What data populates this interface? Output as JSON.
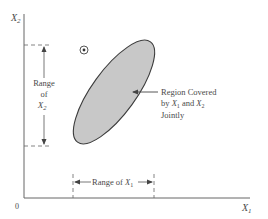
{
  "diagram": {
    "axes": {
      "y_label": "X",
      "y_label_sub": "2",
      "x_label": "X",
      "x_label_sub": "1",
      "origin_label": "0"
    },
    "range_x2": {
      "line1": "Range",
      "line2": "of",
      "line3_var": "X",
      "line3_sub": "2"
    },
    "range_x1": {
      "prefix": "Range of ",
      "var": "X",
      "sub": "1"
    },
    "region_annotation": {
      "line1": "Region Covered",
      "line2_prefix": "by ",
      "line2_var1": "X",
      "line2_sub1": "1",
      "line2_mid": " and ",
      "line2_var2": "X",
      "line2_sub2": "2",
      "line3": "Jointly"
    },
    "colors": {
      "line": "#555555",
      "region_fill": "#c8c8c8",
      "region_stroke": "#3c3c3c",
      "text": "#4a4a4a"
    }
  }
}
